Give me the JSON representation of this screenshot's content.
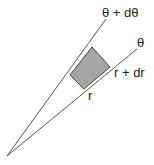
{
  "diagram": {
    "labels": {
      "theta_plus_dtheta": "θ + dθ",
      "theta": "θ",
      "r_plus_dr": "r + dr",
      "r": "r"
    },
    "colors": {
      "line": "#555555",
      "shaded_fill": "#a6a6a6",
      "shaded_stroke": "#444444",
      "text": "#222222"
    }
  }
}
